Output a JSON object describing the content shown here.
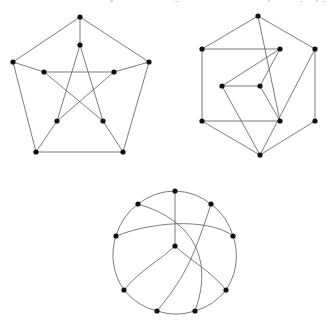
{
  "figure": {
    "background_color": "#ffffff",
    "edge_color": "#5a5a5a",
    "vertex_color": "#111111",
    "vertex_radius": 2.3,
    "edge_width": 0.8,
    "width": 332,
    "height": 326,
    "graph_count": 3
  },
  "graphs": [
    {
      "id": "graph-1",
      "name": "petersen-pentagon-pentagram",
      "label": "Petersen graph, pentagon with inner pentagram",
      "vertex_count": 10,
      "edge_count": 15,
      "vertices": [
        {
          "id": "o0",
          "x": 80,
          "y": 17,
          "ring": "outer"
        },
        {
          "id": "o1",
          "x": 149,
          "y": 62,
          "ring": "outer"
        },
        {
          "id": "o2",
          "x": 123,
          "y": 152,
          "ring": "outer"
        },
        {
          "id": "o3",
          "x": 36,
          "y": 152,
          "ring": "outer"
        },
        {
          "id": "o4",
          "x": 13,
          "y": 62,
          "ring": "outer"
        },
        {
          "id": "i0",
          "x": 80,
          "y": 45,
          "ring": "inner"
        },
        {
          "id": "i1",
          "x": 114,
          "y": 72,
          "ring": "inner"
        },
        {
          "id": "i2",
          "x": 103,
          "y": 121,
          "ring": "inner"
        },
        {
          "id": "i3",
          "x": 57,
          "y": 121,
          "ring": "inner"
        },
        {
          "id": "i4",
          "x": 44,
          "y": 72,
          "ring": "inner"
        }
      ],
      "edges": [
        {
          "from": "o0",
          "to": "o1",
          "kind": "outer-cycle"
        },
        {
          "from": "o1",
          "to": "o2",
          "kind": "outer-cycle"
        },
        {
          "from": "o2",
          "to": "o3",
          "kind": "outer-cycle"
        },
        {
          "from": "o3",
          "to": "o4",
          "kind": "outer-cycle"
        },
        {
          "from": "o4",
          "to": "o0",
          "kind": "outer-cycle"
        },
        {
          "from": "o0",
          "to": "i0",
          "kind": "spoke"
        },
        {
          "from": "o1",
          "to": "i1",
          "kind": "spoke"
        },
        {
          "from": "o2",
          "to": "i2",
          "kind": "spoke"
        },
        {
          "from": "o3",
          "to": "i3",
          "kind": "spoke"
        },
        {
          "from": "o4",
          "to": "i4",
          "kind": "spoke"
        },
        {
          "from": "i0",
          "to": "i2",
          "kind": "pentagram"
        },
        {
          "from": "i2",
          "to": "i4",
          "kind": "pentagram"
        },
        {
          "from": "i4",
          "to": "i1",
          "kind": "pentagram"
        },
        {
          "from": "i1",
          "to": "i3",
          "kind": "pentagram"
        },
        {
          "from": "i3",
          "to": "i0",
          "kind": "pentagram"
        }
      ]
    },
    {
      "id": "graph-2",
      "name": "hexagon-with-inner-rhombus",
      "label": "Petersen graph, hexagonal drawing with inner rhombus",
      "vertex_count": 10,
      "edge_count": 15,
      "vertices": [
        {
          "id": "h0",
          "x": 258,
          "y": 16,
          "ring": "outer"
        },
        {
          "id": "h1",
          "x": 315,
          "y": 49,
          "ring": "outer"
        },
        {
          "id": "h2",
          "x": 315,
          "y": 121,
          "ring": "outer"
        },
        {
          "id": "h3",
          "x": 260,
          "y": 155,
          "ring": "outer"
        },
        {
          "id": "h4",
          "x": 202,
          "y": 121,
          "ring": "outer"
        },
        {
          "id": "h5",
          "x": 202,
          "y": 49,
          "ring": "outer"
        },
        {
          "id": "r0",
          "x": 280,
          "y": 49,
          "ring": "inner"
        },
        {
          "id": "r1",
          "x": 280,
          "y": 121,
          "ring": "inner"
        },
        {
          "id": "r2",
          "x": 260,
          "y": 86,
          "ring": "inner"
        },
        {
          "id": "r3",
          "x": 222,
          "y": 86,
          "ring": "inner"
        }
      ],
      "edges": [
        {
          "from": "h5",
          "to": "h0",
          "kind": "outer"
        },
        {
          "from": "h0",
          "to": "h1",
          "kind": "outer"
        },
        {
          "from": "h1",
          "to": "h2",
          "kind": "outer"
        },
        {
          "from": "h2",
          "to": "h3",
          "kind": "outer"
        },
        {
          "from": "h3",
          "to": "h4",
          "kind": "outer"
        },
        {
          "from": "h4",
          "to": "h5",
          "kind": "outer"
        },
        {
          "from": "h5",
          "to": "r0",
          "kind": "chord"
        },
        {
          "from": "h4",
          "to": "r1",
          "kind": "chord"
        },
        {
          "from": "r0",
          "to": "r2",
          "kind": "rhombus"
        },
        {
          "from": "r2",
          "to": "r3",
          "kind": "rhombus"
        },
        {
          "from": "r3",
          "to": "r0",
          "kind": "long-chord"
        },
        {
          "from": "r2",
          "to": "r1",
          "kind": "rhombus"
        },
        {
          "from": "r3",
          "to": "h3",
          "kind": "long-chord"
        },
        {
          "from": "h0",
          "to": "r1",
          "kind": "long-chord"
        },
        {
          "from": "h1",
          "to": "h3",
          "kind": "long-chord"
        }
      ]
    },
    {
      "id": "graph-3",
      "name": "circular-three-fold-curved",
      "label": "Petersen graph, circular drawing with curved arcs and 3-fold symmetry",
      "vertex_count": 10,
      "edge_count": 15,
      "vertices": [
        {
          "id": "c0",
          "x": 175,
          "y": 191,
          "ring": "rim"
        },
        {
          "id": "c1",
          "x": 211,
          "y": 204,
          "ring": "rim"
        },
        {
          "id": "c2",
          "x": 233,
          "y": 236,
          "ring": "rim"
        },
        {
          "id": "c3",
          "x": 226,
          "y": 290,
          "ring": "rim"
        },
        {
          "id": "c4",
          "x": 195,
          "y": 311,
          "ring": "rim"
        },
        {
          "id": "c5",
          "x": 157,
          "y": 311,
          "ring": "rim"
        },
        {
          "id": "c6",
          "x": 124,
          "y": 290,
          "ring": "rim"
        },
        {
          "id": "c7",
          "x": 116,
          "y": 236,
          "ring": "rim"
        },
        {
          "id": "c8",
          "x": 138,
          "y": 204,
          "ring": "rim"
        },
        {
          "id": "c9",
          "x": 175,
          "y": 246,
          "ring": "center"
        }
      ],
      "circle": {
        "cx": 175,
        "cy": 251,
        "r": 60
      },
      "edges": [
        {
          "from": "c0",
          "to": "c9",
          "kind": "spoke-straight"
        },
        {
          "from": "c9",
          "to": "c3",
          "kind": "spoke-curved"
        },
        {
          "from": "c9",
          "to": "c6",
          "kind": "spoke-curved"
        },
        {
          "from": "c8",
          "to": "c0",
          "kind": "rim-arc"
        },
        {
          "from": "c0",
          "to": "c1",
          "kind": "rim-arc"
        },
        {
          "from": "c1",
          "to": "c2",
          "kind": "rim-arc"
        },
        {
          "from": "c2",
          "to": "c3",
          "kind": "rim-arc"
        },
        {
          "from": "c3",
          "to": "c4",
          "kind": "rim-arc"
        },
        {
          "from": "c4",
          "to": "c5",
          "kind": "rim-arc"
        },
        {
          "from": "c5",
          "to": "c6",
          "kind": "rim-arc"
        },
        {
          "from": "c6",
          "to": "c7",
          "kind": "rim-arc"
        },
        {
          "from": "c7",
          "to": "c8",
          "kind": "rim-arc"
        },
        {
          "from": "c8",
          "to": "c4",
          "kind": "long-arc"
        },
        {
          "from": "c1",
          "to": "c5",
          "kind": "long-arc"
        },
        {
          "from": "c7",
          "to": "c2",
          "kind": "long-arc"
        }
      ]
    }
  ]
}
